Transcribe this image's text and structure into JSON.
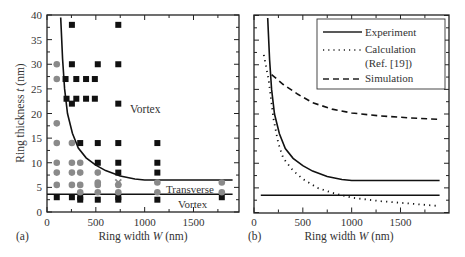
{
  "chart_data": [
    {
      "panel": "(a)",
      "type": "scatter",
      "title": "",
      "xlabel": "Ring width W (nm)",
      "ylabel": "Ring thickness t (nm)",
      "xlim": [
        0,
        1950
      ],
      "ylim": [
        0,
        40
      ],
      "xticks": [
        0,
        500,
        1000,
        1500
      ],
      "yticks": [
        0,
        5,
        10,
        15,
        20,
        25,
        30,
        35,
        40
      ],
      "grid": false,
      "annotations": [
        {
          "text": "Vortex",
          "x": 1150,
          "y": 22
        },
        {
          "text": "Transverse",
          "x": 1350,
          "y": 4.9
        },
        {
          "text": "Vortex",
          "x": 1380,
          "y": 1.7
        }
      ],
      "series": [
        {
          "name": "Vortex (squares)",
          "marker": "square",
          "color": "#111111",
          "points": [
            [
              100,
              3
            ],
            [
              190,
              27
            ],
            [
              200,
              23
            ],
            [
              255,
              38
            ],
            [
              255,
              30
            ],
            [
              255,
              22
            ],
            [
              255,
              3
            ],
            [
              300,
              27
            ],
            [
              300,
              23
            ],
            [
              340,
              14
            ],
            [
              340,
              3
            ],
            [
              340,
              2.5
            ],
            [
              400,
              27
            ],
            [
              400,
              23
            ],
            [
              490,
              27
            ],
            [
              490,
              23
            ],
            [
              520,
              30
            ],
            [
              520,
              14
            ],
            [
              520,
              10
            ],
            [
              520,
              2.5
            ],
            [
              730,
              38
            ],
            [
              730,
              30
            ],
            [
              730,
              22
            ],
            [
              730,
              14
            ],
            [
              730,
              10
            ],
            [
              730,
              8
            ],
            [
              730,
              3
            ],
            [
              730,
              2.5
            ],
            [
              1130,
              14
            ],
            [
              1130,
              10
            ],
            [
              1130,
              8
            ],
            [
              1130,
              2.5
            ],
            [
              1790,
              3
            ]
          ]
        },
        {
          "name": "Transverse (circles)",
          "marker": "circle",
          "color": "#8a8a8a",
          "points": [
            [
              100,
              30
            ],
            [
              100,
              27
            ],
            [
              100,
              18
            ],
            [
              100,
              14
            ],
            [
              100,
              10
            ],
            [
              100,
              8
            ],
            [
              100,
              5.5
            ],
            [
              255,
              14
            ],
            [
              255,
              10
            ],
            [
              255,
              8
            ],
            [
              255,
              5.5
            ],
            [
              340,
              10
            ],
            [
              340,
              8
            ],
            [
              340,
              5.5
            ],
            [
              340,
              4
            ],
            [
              520,
              8
            ],
            [
              520,
              6
            ],
            [
              520,
              5.5
            ],
            [
              520,
              4
            ],
            [
              730,
              5.5
            ],
            [
              730,
              4
            ],
            [
              1130,
              6
            ],
            [
              1130,
              4
            ],
            [
              1790,
              6
            ],
            [
              1790,
              4
            ]
          ]
        },
        {
          "name": "Mixed (x)",
          "marker": "x",
          "color": "#8a8a8a",
          "points": [
            [
              730,
              6
            ]
          ]
        },
        {
          "name": "Upper boundary",
          "type": "line",
          "color": "#111111",
          "points": [
            [
              140,
              39.5
            ],
            [
              160,
              31
            ],
            [
              180,
              25
            ],
            [
              210,
              20
            ],
            [
              260,
              16
            ],
            [
              320,
              13
            ],
            [
              400,
              11
            ],
            [
              500,
              9.5
            ],
            [
              600,
              8.4
            ],
            [
              750,
              7.3
            ],
            [
              900,
              6.7
            ],
            [
              1000,
              6.5
            ],
            [
              1900,
              6.5
            ]
          ]
        },
        {
          "name": "Lower boundary",
          "type": "line",
          "color": "#111111",
          "points": [
            [
              0,
              3.6
            ],
            [
              1900,
              3.6
            ]
          ]
        }
      ]
    },
    {
      "panel": "(b)",
      "type": "line",
      "title": "",
      "xlabel": "Ring width W (nm)",
      "ylabel": "",
      "xlim": [
        0,
        1950
      ],
      "ylim": [
        0,
        40
      ],
      "xticks": [
        0,
        500,
        1000,
        1500
      ],
      "grid": false,
      "legend": {
        "position": "upper right",
        "entries": [
          "Experiment",
          "Calculation (Ref. [19])",
          "Simulation"
        ]
      },
      "series": [
        {
          "name": "Experiment",
          "style": "solid",
          "color": "#111111",
          "points": [
            [
              140,
              39.5
            ],
            [
              160,
              31
            ],
            [
              180,
              25
            ],
            [
              210,
              20
            ],
            [
              260,
              16
            ],
            [
              320,
              13
            ],
            [
              400,
              11
            ],
            [
              500,
              9.5
            ],
            [
              600,
              8.4
            ],
            [
              750,
              7.3
            ],
            [
              900,
              6.7
            ],
            [
              1000,
              6.5
            ],
            [
              1900,
              6.5
            ]
          ]
        },
        {
          "name": "Experiment (lower)",
          "style": "solid",
          "color": "#111111",
          "points": [
            [
              70,
              3.5
            ],
            [
              1900,
              3.5
            ]
          ]
        },
        {
          "name": "Calculation (Ref. [19])",
          "style": "dotted",
          "color": "#111111",
          "points": [
            [
              100,
              32
            ],
            [
              150,
              27
            ],
            [
              200,
              19
            ],
            [
              250,
              14
            ],
            [
              300,
              11
            ],
            [
              400,
              8.5
            ],
            [
              500,
              6.8
            ],
            [
              650,
              5
            ],
            [
              800,
              4
            ],
            [
              1000,
              3
            ],
            [
              1300,
              2.3
            ],
            [
              1600,
              1.8
            ],
            [
              1900,
              1.3
            ]
          ]
        },
        {
          "name": "Simulation",
          "style": "dashed",
          "color": "#111111",
          "points": [
            [
              180,
              28
            ],
            [
              300,
              26
            ],
            [
              450,
              24
            ],
            [
              600,
              22.3
            ],
            [
              800,
              21
            ],
            [
              1000,
              20.2
            ],
            [
              1300,
              19.6
            ],
            [
              1600,
              19.2
            ],
            [
              1900,
              18.9
            ]
          ]
        }
      ]
    }
  ],
  "labels": {
    "panel_a": "(a)",
    "panel_b": "(b)",
    "xlabel_a_pre": "Ring width ",
    "xlabel_a_var": "W",
    "xlabel_a_post": " (nm)",
    "xlabel_b_pre": "Ring width ",
    "xlabel_b_var": "W",
    "xlabel_b_post": " (nm)",
    "ylabel_pre": "Ring thickness ",
    "ylabel_var": "t",
    "ylabel_post": " (nm)",
    "annot_vortex_upper": "Vortex",
    "annot_transverse": "Transverse",
    "annot_vortex_lower": "Vortex",
    "legend_experiment": "Experiment",
    "legend_calculation": "Calculation",
    "legend_calculation_ref": "(Ref. [19])",
    "legend_simulation": "Simulation"
  },
  "ticks": {
    "x": [
      "0",
      "500",
      "1000",
      "1500"
    ],
    "y": [
      "0",
      "5",
      "10",
      "15",
      "20",
      "25",
      "30",
      "35",
      "40"
    ]
  }
}
